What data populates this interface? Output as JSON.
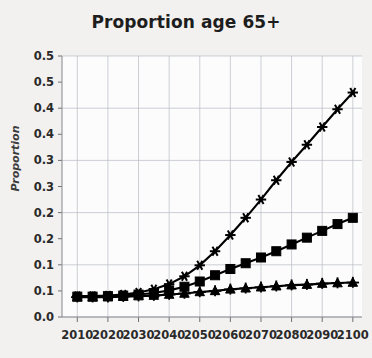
{
  "chart": {
    "title": "Proportion age 65+",
    "ylabel": "Proportion"
  },
  "chart_data": {
    "type": "line",
    "title": "Proportion age 65+",
    "xlabel": "",
    "ylabel": "Proportion",
    "xlim": [
      2005,
      2103
    ],
    "ylim": [
      0.0,
      0.5
    ],
    "grid": true,
    "legend": "none",
    "x_tick_labels": [
      "2010",
      "2020",
      "2030",
      "2040",
      "2050",
      "2060",
      "2070",
      "2080",
      "2090",
      "2100"
    ],
    "x_tick_values": [
      2010,
      2020,
      2030,
      2040,
      2050,
      2060,
      2070,
      2080,
      2090,
      2100
    ],
    "y_tick_labels": [
      "0.0",
      "0.1",
      "0.1",
      "0.2",
      "0.2",
      "0.3",
      "0.3",
      "0.4",
      "0.4",
      "0.5"
    ],
    "y_tick_values": [
      0.0,
      0.05,
      0.1,
      0.15,
      0.2,
      0.25,
      0.3,
      0.35,
      0.4,
      0.45,
      0.5
    ],
    "y_major_gridlines": [
      0.0,
      0.1,
      0.2,
      0.3,
      0.4,
      0.5
    ],
    "x": [
      2010,
      2015,
      2020,
      2025,
      2030,
      2035,
      2040,
      2045,
      2050,
      2055,
      2060,
      2065,
      2070,
      2075,
      2080,
      2085,
      2090,
      2095,
      2100
    ],
    "series": [
      {
        "name": "high-projection",
        "marker": "asterisk",
        "color": "#000000",
        "values": [
          0.04,
          0.04,
          0.041,
          0.043,
          0.047,
          0.053,
          0.063,
          0.078,
          0.099,
          0.126,
          0.157,
          0.19,
          0.225,
          0.262,
          0.297,
          0.33,
          0.364,
          0.398,
          0.43
        ]
      },
      {
        "name": "mid-projection",
        "marker": "square",
        "color": "#000000",
        "values": [
          0.039,
          0.039,
          0.04,
          0.041,
          0.043,
          0.046,
          0.051,
          0.058,
          0.068,
          0.08,
          0.092,
          0.103,
          0.114,
          0.126,
          0.139,
          0.152,
          0.165,
          0.178,
          0.19
        ]
      },
      {
        "name": "low-projection",
        "marker": "triangle-plus",
        "color": "#000000",
        "values": [
          0.038,
          0.038,
          0.038,
          0.039,
          0.04,
          0.041,
          0.043,
          0.045,
          0.048,
          0.05,
          0.053,
          0.055,
          0.057,
          0.059,
          0.061,
          0.062,
          0.064,
          0.065,
          0.066
        ]
      }
    ]
  }
}
